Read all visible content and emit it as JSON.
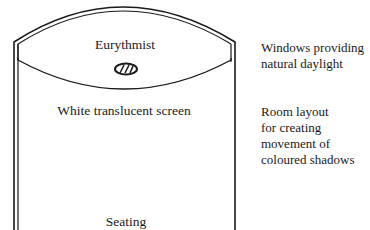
{
  "diagram": {
    "labels": {
      "performer": "Eurythmist",
      "screen": "White translucent screen",
      "seating": "Seating"
    },
    "annotations": [
      {
        "id": "windows",
        "lines": [
          "Windows providing",
          "natural daylight"
        ]
      },
      {
        "id": "layout",
        "lines": [
          "Room layout",
          "for creating",
          "movement of",
          "coloured shadows"
        ]
      }
    ],
    "icons": {
      "performer_marker": "eurythmist-figure-icon"
    },
    "colors": {
      "line": "#1a1a1a",
      "background": "#ffffff"
    }
  }
}
